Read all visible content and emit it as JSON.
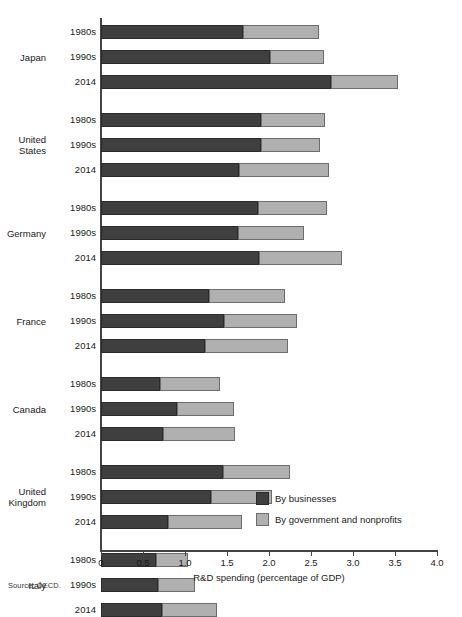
{
  "chart_data": {
    "type": "bar",
    "orientation": "horizontal",
    "stacked": true,
    "title": "",
    "xlabel": "R&D spending (percentage of GDP)",
    "ylabel": "",
    "xlim": [
      0,
      4.0
    ],
    "xticks": [
      "0",
      "0.5",
      "1.0",
      "1.5",
      "2.0",
      "2.5",
      "3.0",
      "3.5",
      "4.0"
    ],
    "xtick_values": [
      0,
      0.5,
      1.0,
      1.5,
      2.0,
      2.5,
      3.0,
      3.5,
      4.0
    ],
    "grid": false,
    "legend_position": "inside-lower-right",
    "series": [
      {
        "name": "By businesses",
        "color": "#3f3f3f"
      },
      {
        "name": "By government and nonprofits",
        "color": "#b0b0b0"
      }
    ],
    "groups": [
      {
        "country": "Japan",
        "rows": [
          {
            "period": "1980s",
            "business": 1.69,
            "government": 0.91,
            "total": 2.6
          },
          {
            "period": "1990s",
            "business": 2.01,
            "government": 0.64,
            "total": 2.65
          },
          {
            "period": "2014",
            "business": 2.74,
            "government": 0.8,
            "total": 3.54
          }
        ]
      },
      {
        "country": "United States",
        "rows": [
          {
            "period": "1980s",
            "business": 1.9,
            "government": 0.77,
            "total": 2.67
          },
          {
            "period": "1990s",
            "business": 1.9,
            "government": 0.71,
            "total": 2.61
          },
          {
            "period": "2014",
            "business": 1.64,
            "government": 1.08,
            "total": 2.72
          }
        ]
      },
      {
        "country": "Germany",
        "rows": [
          {
            "period": "1980s",
            "business": 1.87,
            "government": 0.82,
            "total": 2.69
          },
          {
            "period": "1990s",
            "business": 1.63,
            "government": 0.79,
            "total": 2.42
          },
          {
            "period": "2014",
            "business": 1.88,
            "government": 0.99,
            "total": 2.87
          }
        ]
      },
      {
        "country": "France",
        "rows": [
          {
            "period": "1980s",
            "business": 1.29,
            "government": 0.9,
            "total": 2.19
          },
          {
            "period": "1990s",
            "business": 1.46,
            "government": 0.87,
            "total": 2.33
          },
          {
            "period": "2014",
            "business": 1.24,
            "government": 0.99,
            "total": 2.23
          }
        ]
      },
      {
        "country": "Canada",
        "rows": [
          {
            "period": "1980s",
            "business": 0.7,
            "government": 0.72,
            "total": 1.42
          },
          {
            "period": "1990s",
            "business": 0.9,
            "government": 0.68,
            "total": 1.58
          },
          {
            "period": "2014",
            "business": 0.74,
            "government": 0.85,
            "total": 1.59
          }
        ]
      },
      {
        "country": "United Kingdom",
        "rows": [
          {
            "period": "1980s",
            "business": 1.45,
            "government": 0.8,
            "total": 2.25
          },
          {
            "period": "1990s",
            "business": 1.31,
            "government": 0.73,
            "total": 2.04
          },
          {
            "period": "2014",
            "business": 0.8,
            "government": 0.88,
            "total": 1.68
          }
        ]
      },
      {
        "country": "Italy",
        "rows": [
          {
            "period": "1980s",
            "business": 0.66,
            "government": 0.37,
            "total": 1.03
          },
          {
            "period": "1990s",
            "business": 0.68,
            "government": 0.44,
            "total": 1.12
          },
          {
            "period": "2014",
            "business": 0.73,
            "government": 0.65,
            "total": 1.38
          }
        ]
      }
    ]
  },
  "legend": {
    "items": [
      {
        "label": "By businesses",
        "key": "business"
      },
      {
        "label": "By government and nonprofits",
        "key": "gov"
      }
    ]
  },
  "source": {
    "text": "Source: OECD."
  }
}
